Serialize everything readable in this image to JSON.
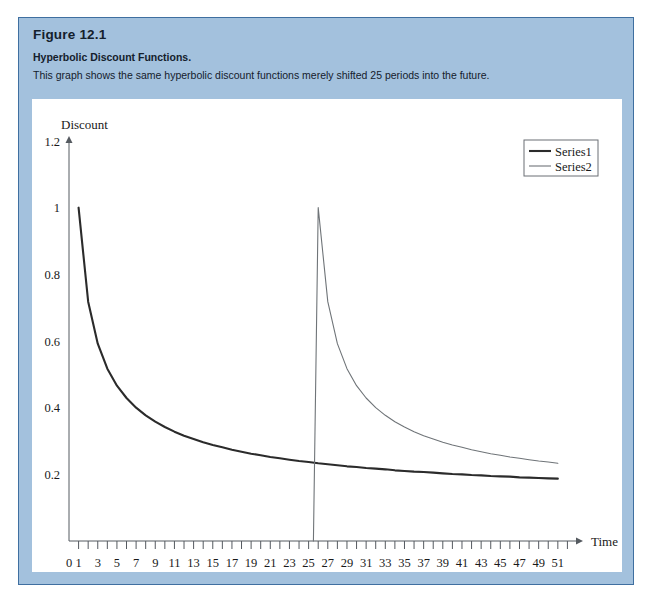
{
  "figure": {
    "number": "Figure 12.1",
    "subtitle": "Hyperbolic Discount Functions.",
    "caption": "This graph shows the same hyperbolic discount functions merely shifted 25 periods into the future.",
    "panel_color": "#a3c1dd",
    "panel_border_color": "#3f6fa0",
    "canvas_color": "#ffffff"
  },
  "chart_data": {
    "type": "line",
    "title": "",
    "xlabel": "Time",
    "ylabel": "Discount",
    "xlim": [
      0,
      53
    ],
    "ylim": [
      0,
      1.2
    ],
    "grid": false,
    "legend_position": "top-right",
    "y_ticks": [
      "1.2",
      "1",
      "0.8",
      "0.6",
      "0.4",
      "0.2"
    ],
    "y_tick_values": [
      1.2,
      1,
      0.8,
      0.6,
      0.4,
      0.2
    ],
    "x_ticks": [
      "0",
      "1",
      "3",
      "5",
      "7",
      "9",
      "11",
      "13",
      "15",
      "17",
      "19",
      "21",
      "23",
      "25",
      "27",
      "29",
      "31",
      "33",
      "35",
      "37",
      "39",
      "41",
      "43",
      "45",
      "47",
      "49",
      "51"
    ],
    "x_tick_values": [
      0,
      1,
      3,
      5,
      7,
      9,
      11,
      13,
      15,
      17,
      19,
      21,
      23,
      25,
      27,
      29,
      31,
      33,
      35,
      37,
      39,
      41,
      43,
      45,
      47,
      49,
      51
    ],
    "x_minor_ticks": [
      2,
      4,
      6,
      8,
      10,
      12,
      14,
      16,
      18,
      20,
      22,
      24,
      26,
      28,
      30,
      32,
      34,
      36,
      38,
      40,
      42,
      44,
      46,
      48,
      50,
      52
    ],
    "series": [
      {
        "name": "Series1",
        "color": "#2b2b2b",
        "width": 2.1,
        "x": [
          1,
          2,
          3,
          4,
          5,
          6,
          7,
          8,
          9,
          10,
          11,
          12,
          13,
          14,
          15,
          16,
          17,
          18,
          19,
          20,
          21,
          22,
          23,
          24,
          25,
          26,
          27,
          28,
          29,
          30,
          31,
          32,
          33,
          34,
          35,
          36,
          37,
          38,
          39,
          40,
          41,
          42,
          43,
          44,
          45,
          46,
          47,
          48,
          49,
          50,
          51
        ],
        "values": [
          1.0,
          0.718,
          0.592,
          0.517,
          0.466,
          0.429,
          0.4,
          0.377,
          0.358,
          0.342,
          0.328,
          0.316,
          0.306,
          0.296,
          0.288,
          0.281,
          0.274,
          0.268,
          0.262,
          0.257,
          0.252,
          0.248,
          0.244,
          0.24,
          0.237,
          0.233,
          0.23,
          0.227,
          0.224,
          0.222,
          0.219,
          0.217,
          0.215,
          0.212,
          0.21,
          0.208,
          0.207,
          0.205,
          0.203,
          0.201,
          0.2,
          0.198,
          0.197,
          0.195,
          0.194,
          0.193,
          0.191,
          0.19,
          0.189,
          0.188,
          0.187
        ]
      },
      {
        "name": "Series2",
        "color": "#6f7478",
        "width": 1.1,
        "x": [
          25.5,
          26,
          27,
          28,
          29,
          30,
          31,
          32,
          33,
          34,
          35,
          36,
          37,
          38,
          39,
          40,
          41,
          42,
          43,
          44,
          45,
          46,
          47,
          48,
          49,
          50,
          51
        ],
        "values": [
          0.0,
          1.0,
          0.718,
          0.592,
          0.517,
          0.466,
          0.429,
          0.4,
          0.377,
          0.358,
          0.342,
          0.328,
          0.316,
          0.306,
          0.296,
          0.288,
          0.281,
          0.274,
          0.268,
          0.262,
          0.257,
          0.252,
          0.248,
          0.244,
          0.24,
          0.237,
          0.233
        ]
      }
    ],
    "legend": [
      {
        "label": "Series1",
        "color": "#2b2b2b"
      },
      {
        "label": "Series2",
        "color": "#6f7478"
      }
    ]
  }
}
